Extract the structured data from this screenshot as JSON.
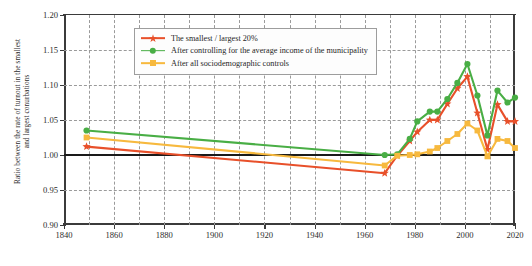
{
  "chart_data": {
    "type": "line",
    "title": "",
    "xlabel": "",
    "ylabel": "Ratio between the rate of turnout in the smallest and largest conurbations",
    "ylabel_lines": [
      "Ratio between the rate of turnout in the smallest",
      "and largest conurbations"
    ],
    "xlim": [
      1840,
      2020
    ],
    "ylim": [
      0.9,
      1.2
    ],
    "yticks": [
      "1.20",
      "1.15",
      "1.10",
      "1.05",
      "1.00",
      "0.95",
      "0.90"
    ],
    "ytick_values": [
      1.2,
      1.15,
      1.1,
      1.05,
      1.0,
      0.95,
      0.9
    ],
    "xticks": [
      "1840",
      "1860",
      "1880",
      "1900",
      "1920",
      "1940",
      "1960",
      "1980",
      "2000",
      "2020"
    ],
    "xtick_values": [
      1840,
      1860,
      1880,
      1900,
      1920,
      1940,
      1960,
      1980,
      2000,
      2020
    ],
    "xminor_values": [
      1850,
      1870,
      1890,
      1910,
      1930,
      1950,
      1970,
      1990,
      2010
    ],
    "grid": true,
    "reference_line": 1.0,
    "legend_position": "top-center",
    "series": [
      {
        "name": "The smallest / largest 20%",
        "color": "#E8502A",
        "marker": "star",
        "x": [
          1849,
          1968,
          1973,
          1978,
          1981,
          1986,
          1989,
          1993,
          1997,
          2001,
          2005,
          2009,
          2013,
          2017,
          2020
        ],
        "values": [
          1.012,
          0.974,
          0.999,
          1.02,
          1.033,
          1.05,
          1.05,
          1.073,
          1.095,
          1.112,
          1.06,
          1.008,
          1.072,
          1.048,
          1.048
        ]
      },
      {
        "name": "After controlling for the average income of the municipality",
        "color": "#49AE45",
        "marker": "circle",
        "x": [
          1849,
          1968,
          1973,
          1978,
          1981,
          1986,
          1989,
          1993,
          1997,
          2001,
          2005,
          2009,
          2013,
          2017,
          2020
        ],
        "values": [
          1.035,
          1.0,
          1.001,
          1.023,
          1.048,
          1.062,
          1.062,
          1.08,
          1.103,
          1.13,
          1.085,
          1.028,
          1.092,
          1.075,
          1.082
        ]
      },
      {
        "name": "After all sociodemographic controls",
        "color": "#F5B game",
        "marker": "square",
        "x": [
          1849,
          1968,
          1973,
          1978,
          1981,
          1986,
          1989,
          1993,
          1997,
          2001,
          2005,
          2009,
          2013,
          2017,
          2020
        ],
        "values": [
          1.025,
          0.985,
          0.999,
          1.0,
          1.001,
          1.005,
          1.01,
          1.02,
          1.03,
          1.045,
          1.035,
          0.998,
          1.023,
          1.02,
          1.01
        ]
      }
    ]
  },
  "legend": {
    "items": [
      {
        "label": "The smallest / largest 20%",
        "color": "#E8502A",
        "marker": "star"
      },
      {
        "label": "After controlling for the average income of the municipality",
        "color": "#49AE45",
        "marker": "circle"
      },
      {
        "label": "After all sociodemographic controls",
        "color": "#F7B93E",
        "marker": "square"
      }
    ]
  },
  "colors": {
    "series_red": "#E8502A",
    "series_green": "#49AE45",
    "series_yellow": "#F7B93E",
    "axis": "#3b3b3b",
    "grid": "#9a9a9a",
    "baseline": "#1a1a1a",
    "background": "#ffffff"
  }
}
